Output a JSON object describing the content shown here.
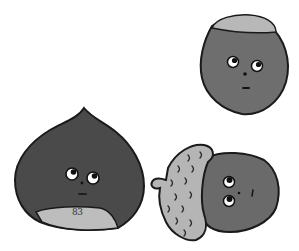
{
  "illustration": {
    "subject": "Three cartoon nuts with faces looking upward",
    "characters": [
      {
        "name": "chestnut",
        "body_color": "#4a4a4a",
        "base_color": "#bdbdbd"
      },
      {
        "name": "hazelnut",
        "body_color": "#6e6e6e",
        "cap_color": "#b8b8b8"
      },
      {
        "name": "acorn",
        "body_color": "#6a6a6a",
        "cap_color": "#b5b5b5"
      }
    ],
    "page_number": "83",
    "outline_color": "#1a1a1a",
    "background": "#ffffff"
  }
}
